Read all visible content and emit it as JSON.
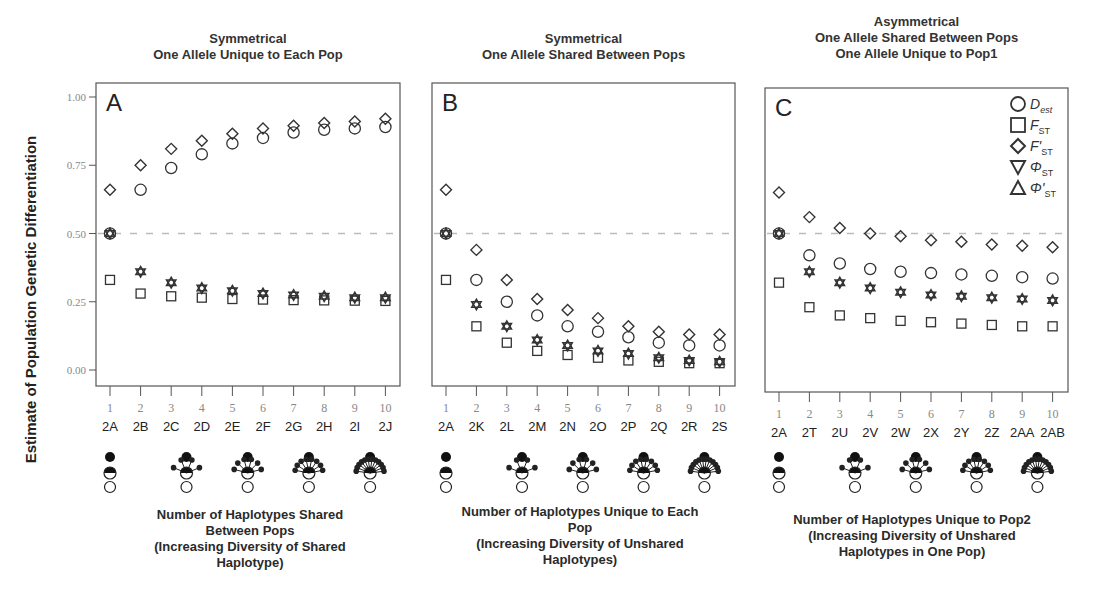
{
  "figure": {
    "ylabel": "Estimate of Population Genetic Differentiation",
    "yticks": [
      "0.00",
      "0.25",
      "0.50",
      "0.75",
      "1.00"
    ],
    "reference_line": 0.5,
    "colors": {
      "marker": "#333333",
      "axis": "#555555",
      "refline": "#bbbbbb",
      "tick_text": "#888888"
    }
  },
  "legend": [
    {
      "symbol": "circle",
      "label": "D",
      "sub": "est",
      "italic_sub": true
    },
    {
      "symbol": "square",
      "label": "F",
      "sub": "ST"
    },
    {
      "symbol": "diamond",
      "label": "F'",
      "sub": "ST"
    },
    {
      "symbol": "triangle-down",
      "label": "Φ",
      "sub": "ST"
    },
    {
      "symbol": "triangle-up",
      "label": "Φ'",
      "sub": "ST"
    }
  ],
  "panels": [
    {
      "letter": "A",
      "title": [
        "Symmetrical",
        "One Allele Unique to Each Pop"
      ],
      "xcaption": [
        "Number of Haplotypes Shared",
        "Between Pops",
        "(Increasing Diversity of Shared",
        "Haplotype)"
      ]
    },
    {
      "letter": "B",
      "title": [
        "Symmetrical",
        "One Allele Shared Between Pops"
      ],
      "xcaption": [
        "Number of Haplotypes Unique to Each",
        "Pop",
        "(Increasing Diversity of Unshared",
        "Haplotypes)"
      ]
    },
    {
      "letter": "C",
      "title": [
        "Asymmetrical",
        "One Allele Shared Between Pops",
        "One Allele Unique to Pop1"
      ],
      "xcaption": [
        "Number of Haplotypes Unique to Pop2",
        "(Increasing Diversity of Unshared",
        "Haplotypes in One Pop)"
      ]
    }
  ],
  "chart_data": [
    {
      "type": "scatter",
      "panel": "A",
      "title": "Symmetrical — One Allele Unique to Each Pop",
      "xlabel": "Number of Haplotypes Shared Between Pops (Increasing Diversity of Shared Haplotype)",
      "ylabel": "Estimate of Population Genetic Differentiation",
      "x": [
        1,
        2,
        3,
        4,
        5,
        6,
        7,
        8,
        9,
        10
      ],
      "x_scenarios": [
        "2A",
        "2B",
        "2C",
        "2D",
        "2E",
        "2F",
        "2G",
        "2H",
        "2I",
        "2J"
      ],
      "ylim": [
        0,
        1
      ],
      "grid": false,
      "reference_line": 0.5,
      "series": [
        {
          "name": "Dest",
          "marker": "circle",
          "values": [
            0.5,
            0.66,
            0.74,
            0.79,
            0.83,
            0.85,
            0.87,
            0.88,
            0.885,
            0.89
          ]
        },
        {
          "name": "FST",
          "marker": "square",
          "values": [
            0.33,
            0.28,
            0.27,
            0.265,
            0.26,
            0.258,
            0.256,
            0.255,
            0.254,
            0.253
          ]
        },
        {
          "name": "F'ST",
          "marker": "diamond",
          "values": [
            0.66,
            0.75,
            0.81,
            0.84,
            0.865,
            0.885,
            0.895,
            0.905,
            0.91,
            0.92
          ]
        },
        {
          "name": "ΦST",
          "marker": "triangle-down",
          "values": [
            0.5,
            0.36,
            0.32,
            0.3,
            0.29,
            0.28,
            0.275,
            0.27,
            0.265,
            0.265
          ]
        },
        {
          "name": "Φ'ST",
          "marker": "triangle-up",
          "values": [
            0.5,
            0.36,
            0.32,
            0.3,
            0.29,
            0.28,
            0.275,
            0.27,
            0.265,
            0.265
          ]
        }
      ]
    },
    {
      "type": "scatter",
      "panel": "B",
      "title": "Symmetrical — One Allele Shared Between Pops",
      "xlabel": "Number of Haplotypes Unique to Each Pop (Increasing Diversity of Unshared Haplotypes)",
      "ylabel": "Estimate of Population Genetic Differentiation",
      "x": [
        1,
        2,
        3,
        4,
        5,
        6,
        7,
        8,
        9,
        10
      ],
      "x_scenarios": [
        "2A",
        "2K",
        "2L",
        "2M",
        "2N",
        "2O",
        "2P",
        "2Q",
        "2R",
        "2S"
      ],
      "ylim": [
        0,
        1
      ],
      "grid": false,
      "reference_line": 0.5,
      "series": [
        {
          "name": "Dest",
          "marker": "circle",
          "values": [
            0.5,
            0.33,
            0.25,
            0.2,
            0.16,
            0.14,
            0.12,
            0.1,
            0.09,
            0.09
          ]
        },
        {
          "name": "FST",
          "marker": "square",
          "values": [
            0.33,
            0.16,
            0.1,
            0.07,
            0.055,
            0.045,
            0.035,
            0.03,
            0.025,
            0.025
          ]
        },
        {
          "name": "F'ST",
          "marker": "diamond",
          "values": [
            0.66,
            0.44,
            0.33,
            0.26,
            0.22,
            0.19,
            0.16,
            0.14,
            0.13,
            0.13
          ]
        },
        {
          "name": "ΦST",
          "marker": "triangle-down",
          "values": [
            0.5,
            0.24,
            0.16,
            0.11,
            0.09,
            0.07,
            0.06,
            0.045,
            0.035,
            0.03
          ]
        },
        {
          "name": "Φ'ST",
          "marker": "triangle-up",
          "values": [
            0.5,
            0.24,
            0.16,
            0.11,
            0.09,
            0.07,
            0.06,
            0.045,
            0.035,
            0.03
          ]
        }
      ]
    },
    {
      "type": "scatter",
      "panel": "C",
      "title": "Asymmetrical — One Allele Shared Between Pops, One Allele Unique to Pop1",
      "xlabel": "Number of Haplotypes Unique to Pop2 (Increasing Diversity of Unshared Haplotypes in One Pop)",
      "ylabel": "Estimate of Population Genetic Differentiation",
      "x": [
        1,
        2,
        3,
        4,
        5,
        6,
        7,
        8,
        9,
        10
      ],
      "x_scenarios": [
        "2A",
        "2T",
        "2U",
        "2V",
        "2W",
        "2X",
        "2Y",
        "2Z",
        "2AA",
        "2AB"
      ],
      "ylim": [
        0,
        1
      ],
      "grid": false,
      "reference_line": 0.5,
      "legend_position": "top-right",
      "series": [
        {
          "name": "Dest",
          "marker": "circle",
          "values": [
            0.5,
            0.42,
            0.39,
            0.37,
            0.36,
            0.355,
            0.35,
            0.345,
            0.34,
            0.335
          ]
        },
        {
          "name": "FST",
          "marker": "square",
          "values": [
            0.32,
            0.23,
            0.2,
            0.19,
            0.18,
            0.175,
            0.17,
            0.165,
            0.16,
            0.16
          ]
        },
        {
          "name": "F'ST",
          "marker": "diamond",
          "values": [
            0.65,
            0.56,
            0.52,
            0.5,
            0.49,
            0.475,
            0.47,
            0.46,
            0.455,
            0.45
          ]
        },
        {
          "name": "ΦST",
          "marker": "triangle-down",
          "values": [
            0.5,
            0.36,
            0.32,
            0.3,
            0.285,
            0.275,
            0.27,
            0.265,
            0.26,
            0.255
          ]
        },
        {
          "name": "Φ'ST",
          "marker": "triangle-up",
          "values": [
            0.5,
            0.36,
            0.32,
            0.3,
            0.285,
            0.275,
            0.27,
            0.265,
            0.26,
            0.255
          ]
        }
      ]
    }
  ]
}
